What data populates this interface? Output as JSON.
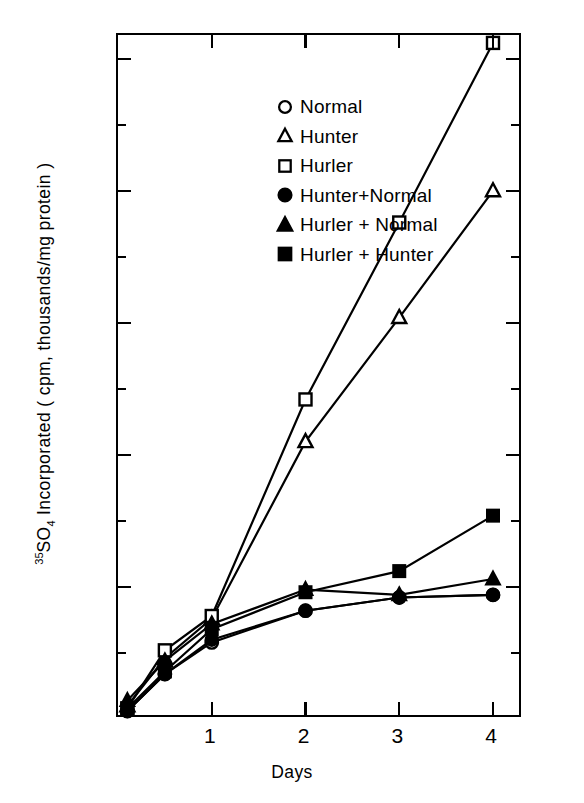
{
  "chart_data": {
    "type": "line",
    "title": "",
    "xlabel": "Days",
    "ylabel": "35SO4 Incorporated ( cpm, thousands/mg protein )",
    "ylabel_parts": {
      "sup": "35",
      "species": "SO",
      "sub": "4",
      "rest": " Incorporated   ( cpm, thousands/mg protein )"
    },
    "xlim": [
      0,
      4.32
    ],
    "ylim": [
      0,
      259
    ],
    "grid": false,
    "legend_position": "upper-left-inside",
    "x_ticks": [
      1,
      2,
      3,
      4
    ],
    "x_tick_labels": [
      "1",
      "2",
      "3",
      "4"
    ],
    "y_ticks_major": [
      0,
      50,
      100,
      150,
      200,
      250
    ],
    "y_tick_labels": [
      "0",
      "50",
      "100",
      "150",
      "200",
      "250"
    ],
    "y_ticks_minor": [
      25,
      75,
      125,
      175,
      225
    ],
    "x": [
      0.1,
      0.5,
      1,
      2,
      3,
      4
    ],
    "series": [
      {
        "name": "Normal",
        "marker": "open-circle",
        "x": [
          0.1,
          0.5,
          1,
          2,
          3,
          4
        ],
        "values": [
          3,
          17,
          29,
          41,
          46,
          47
        ]
      },
      {
        "name": "Hunter",
        "marker": "open-triangle",
        "x": [
          0.1,
          0.5,
          1,
          2,
          3,
          4
        ],
        "values": [
          5,
          23,
          38,
          105,
          152,
          200
        ]
      },
      {
        "name": "Hurler",
        "marker": "open-square",
        "x": [
          0.1,
          0.5,
          1,
          2,
          3,
          4
        ],
        "values": [
          4,
          26,
          39,
          121,
          188,
          256
        ]
      },
      {
        "name": "Hunter+Normal",
        "marker": "filled-circle",
        "x": [
          0.1,
          0.5,
          1,
          2,
          3,
          4
        ],
        "values": [
          3,
          17,
          30,
          41,
          46,
          47
        ]
      },
      {
        "name": "Hurler + Normal",
        "marker": "filled-triangle",
        "x": [
          0.1,
          0.5,
          1,
          2,
          3,
          4
        ],
        "values": [
          7,
          22,
          36,
          49,
          47,
          53
        ]
      },
      {
        "name": "Hurler + Hunter",
        "marker": "filled-square",
        "x": [
          0.1,
          0.5,
          1,
          2,
          3,
          4
        ],
        "values": [
          4,
          18,
          34,
          48,
          56,
          77
        ]
      }
    ]
  },
  "legend": {
    "items": [
      {
        "label": "Normal",
        "marker": "open-circle"
      },
      {
        "label": "Hunter",
        "marker": "open-triangle"
      },
      {
        "label": "Hurler",
        "marker": "open-square"
      },
      {
        "label": "Hunter+Normal",
        "marker": "filled-circle"
      },
      {
        "label": "Hurler + Normal",
        "marker": "filled-triangle"
      },
      {
        "label": "Hurler + Hunter",
        "marker": "filled-square"
      }
    ]
  },
  "axes": {
    "x_title": "Days",
    "y_title_sup": "35",
    "y_title_main": "SO",
    "y_title_sub": "4",
    "y_title_rest": " Incorporated   ( cpm, thousands/mg protein )"
  },
  "colors": {
    "ink": "#000000",
    "background": "#ffffff"
  }
}
